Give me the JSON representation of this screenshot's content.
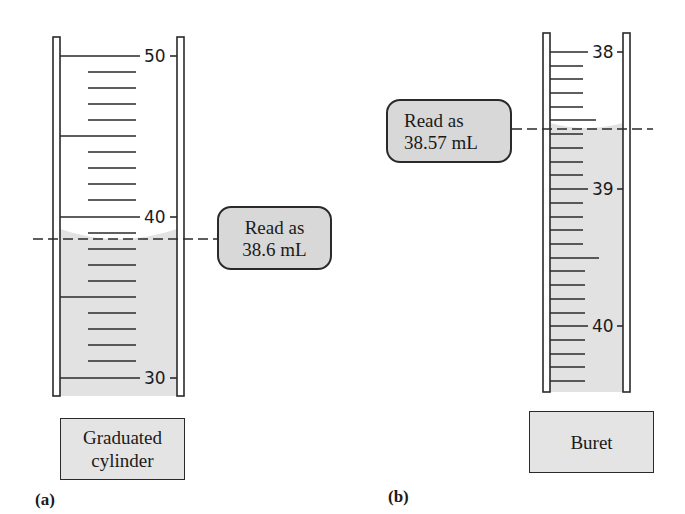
{
  "panel_a": {
    "letter": "(a)",
    "instrument_label_line1": "Graduated",
    "instrument_label_line2": "cylinder",
    "callout_line1": "Read as",
    "callout_line2": "38.6 mL",
    "scale_labels": [
      "50",
      "40",
      "30"
    ],
    "reading_ml": 38.6
  },
  "panel_b": {
    "letter": "(b)",
    "instrument_label": "Buret",
    "callout_line1": "Read as",
    "callout_line2": "38.57 mL",
    "scale_labels": [
      "38",
      "39",
      "40"
    ],
    "reading_ml": 38.57
  },
  "colors": {
    "liquid": "#e2e2e2",
    "callout_fill": "#d8d8d8",
    "line": "#2a2a2a"
  }
}
